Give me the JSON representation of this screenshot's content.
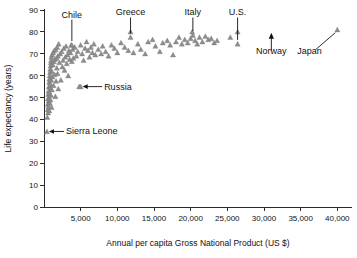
{
  "chart_data": {
    "type": "scatter",
    "title": "",
    "xlabel": "Annual per capita Gross National Product (US $)",
    "ylabel": "Life expectancy (years)",
    "xlim": [
      0,
      42000
    ],
    "ylim": [
      0,
      90
    ],
    "xticks": [
      0,
      5000,
      10000,
      15000,
      20000,
      25000,
      30000,
      35000,
      40000
    ],
    "xticklabels": [
      "0",
      "5,000",
      "10,000",
      "15,000",
      "20,000",
      "25,000",
      "30,000",
      "35,000",
      "40,000"
    ],
    "yticks": [
      0,
      10,
      20,
      30,
      40,
      50,
      60,
      70,
      80,
      90
    ],
    "yticklabels": [
      "0",
      "10",
      "20",
      "30",
      "40",
      "50",
      "60",
      "70",
      "80",
      "90"
    ],
    "grid": false,
    "legend": false,
    "marker": "triangle",
    "marker_color": "#8d8d8d",
    "series": [
      {
        "name": "Countries",
        "points": [
          [
            400,
            34.5
          ],
          [
            450,
            41.0
          ],
          [
            500,
            44.5
          ],
          [
            520,
            47.0
          ],
          [
            540,
            49.5
          ],
          [
            560,
            43.0
          ],
          [
            580,
            51.5
          ],
          [
            600,
            46.0
          ],
          [
            620,
            53.0
          ],
          [
            640,
            48.5
          ],
          [
            660,
            55.0
          ],
          [
            680,
            50.0
          ],
          [
            700,
            57.0
          ],
          [
            720,
            44.0
          ],
          [
            740,
            58.5
          ],
          [
            760,
            52.0
          ],
          [
            780,
            60.0
          ],
          [
            800,
            47.5
          ],
          [
            820,
            61.5
          ],
          [
            840,
            54.5
          ],
          [
            860,
            63.0
          ],
          [
            880,
            49.0
          ],
          [
            900,
            64.5
          ],
          [
            920,
            56.0
          ],
          [
            940,
            66.0
          ],
          [
            960,
            51.0
          ],
          [
            980,
            67.0
          ],
          [
            1000,
            58.0
          ],
          [
            1020,
            68.5
          ],
          [
            1040,
            45.5
          ],
          [
            1060,
            62.0
          ],
          [
            1080,
            53.5
          ],
          [
            1100,
            69.5
          ],
          [
            1150,
            59.5
          ],
          [
            1200,
            65.0
          ],
          [
            1250,
            70.5
          ],
          [
            1300,
            55.5
          ],
          [
            1350,
            66.5
          ],
          [
            1400,
            71.5
          ],
          [
            1450,
            60.5
          ],
          [
            1500,
            67.5
          ],
          [
            1550,
            50.5
          ],
          [
            1600,
            72.0
          ],
          [
            1650,
            57.5
          ],
          [
            1700,
            68.0
          ],
          [
            1750,
            63.5
          ],
          [
            1800,
            73.0
          ],
          [
            1850,
            61.0
          ],
          [
            1900,
            69.0
          ],
          [
            1950,
            54.0
          ],
          [
            2000,
            74.5
          ],
          [
            2100,
            66.0
          ],
          [
            2200,
            70.0
          ],
          [
            2300,
            58.0
          ],
          [
            2400,
            71.0
          ],
          [
            2500,
            64.0
          ],
          [
            2600,
            67.0
          ],
          [
            2700,
            72.5
          ],
          [
            2800,
            62.5
          ],
          [
            2900,
            68.5
          ],
          [
            3000,
            73.5
          ],
          [
            3100,
            65.5
          ],
          [
            3200,
            69.5
          ],
          [
            3300,
            60.0
          ],
          [
            3400,
            71.5
          ],
          [
            3500,
            67.5
          ],
          [
            3600,
            70.5
          ],
          [
            3700,
            74.0
          ],
          [
            3800,
            66.5
          ],
          [
            3900,
            72.0
          ],
          [
            4000,
            68.0
          ],
          [
            4200,
            73.0
          ],
          [
            4400,
            69.0
          ],
          [
            4600,
            71.0
          ],
          [
            4800,
            55.0
          ],
          [
            5000,
            74.0
          ],
          [
            5200,
            70.0
          ],
          [
            5400,
            67.0
          ],
          [
            5600,
            72.5
          ],
          [
            5800,
            75.5
          ],
          [
            6000,
            71.5
          ],
          [
            6200,
            68.5
          ],
          [
            6400,
            73.0
          ],
          [
            6600,
            70.5
          ],
          [
            6800,
            74.5
          ],
          [
            7000,
            69.5
          ],
          [
            7400,
            72.0
          ],
          [
            7800,
            70.0
          ],
          [
            8000,
            73.5
          ],
          [
            8400,
            71.0
          ],
          [
            8800,
            69.0
          ],
          [
            9200,
            74.0
          ],
          [
            9600,
            72.5
          ],
          [
            10000,
            70.5
          ],
          [
            10500,
            75.0
          ],
          [
            11000,
            73.0
          ],
          [
            11500,
            71.5
          ],
          [
            11800,
            77.5
          ],
          [
            12200,
            70.5
          ],
          [
            12800,
            74.5
          ],
          [
            13200,
            72.0
          ],
          [
            13800,
            70.0
          ],
          [
            14200,
            75.5
          ],
          [
            14800,
            76.5
          ],
          [
            15200,
            73.5
          ],
          [
            15800,
            71.0
          ],
          [
            16200,
            75.0
          ],
          [
            16800,
            76.0
          ],
          [
            17200,
            74.0
          ],
          [
            17600,
            69.5
          ],
          [
            18000,
            75.5
          ],
          [
            18400,
            77.5
          ],
          [
            18800,
            74.5
          ],
          [
            19200,
            76.5
          ],
          [
            19600,
            75.0
          ],
          [
            20000,
            77.0
          ],
          [
            20300,
            78.5
          ],
          [
            20600,
            76.0
          ],
          [
            20900,
            74.5
          ],
          [
            21200,
            77.5
          ],
          [
            21600,
            75.5
          ],
          [
            22000,
            78.0
          ],
          [
            22400,
            76.5
          ],
          [
            22800,
            77.0
          ],
          [
            23200,
            75.0
          ],
          [
            23600,
            76.0
          ],
          [
            25400,
            77.5
          ],
          [
            26400,
            74.5
          ],
          [
            40000,
            81.0
          ],
          [
            3800,
            74.0
          ],
          [
            11800,
            80.0
          ],
          [
            20200,
            80.0
          ],
          [
            26400,
            80.0
          ],
          [
            5000,
            55.0
          ]
        ]
      }
    ],
    "annotations": [
      {
        "label": "Chile",
        "x": 3800,
        "y": 74.0,
        "label_x": 3800,
        "label_y": 86.5,
        "type": "leader-down"
      },
      {
        "label": "Greece",
        "x": 11800,
        "y": 77.5,
        "label_x": 11800,
        "label_y": 87.5,
        "type": "leader-down"
      },
      {
        "label": "Italy",
        "x": 20300,
        "y": 78.5,
        "label_x": 20300,
        "label_y": 87.5,
        "type": "leader-down"
      },
      {
        "label": "U.S.",
        "x": 26400,
        "y": 74.5,
        "label_x": 26400,
        "label_y": 87.5,
        "type": "leader-down"
      },
      {
        "label": "Norway",
        "x": 31000,
        "y": 79.0,
        "label_x": 31000,
        "label_y": 70.0,
        "type": "arrow-up"
      },
      {
        "label": "Japan",
        "x": 40000,
        "y": 81.0,
        "label_x": 36200,
        "label_y": 70.0,
        "type": "leader-diagonal"
      },
      {
        "label": "Russia",
        "x": 5000,
        "y": 55.0,
        "label_x": 8200,
        "label_y": 55.0,
        "type": "leader-left"
      },
      {
        "label": "Sierra Leone",
        "x": 400,
        "y": 34.5,
        "label_x": 3000,
        "label_y": 34.5,
        "type": "leader-left"
      }
    ]
  }
}
